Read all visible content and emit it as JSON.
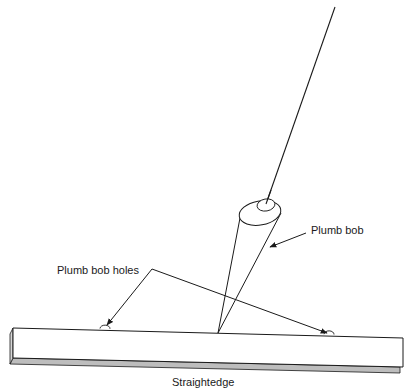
{
  "diagram": {
    "labels": {
      "plumb_bob": "Plumb bob",
      "plumb_bob_holes": "Plumb bob holes",
      "straightedge": "Straightedge"
    },
    "colors": {
      "line": "#1a1a1a",
      "bar_fill": "#ffffff",
      "bar_shade": "#bdbdbd",
      "background": "#ffffff"
    },
    "parts": [
      "string",
      "plumb-bob",
      "straightedge",
      "plumb-bob-hole-left",
      "plumb-bob-hole-right"
    ]
  }
}
